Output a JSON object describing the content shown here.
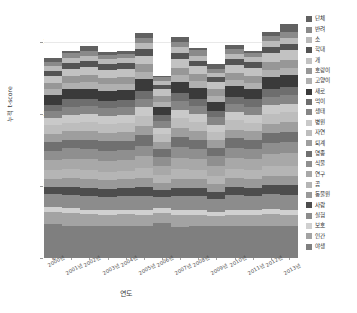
{
  "chart": {
    "type": "bar",
    "title": "",
    "xlabel": "연도",
    "ylabel": "누적 t-score",
    "ytick_labels": [
      "0",
      "100",
      "200",
      "300"
    ],
    "legend_position": "right"
  },
  "chart_data": {
    "type": "bar",
    "stacked": true,
    "title": "",
    "xlabel": "연도",
    "ylabel": "누적 t-score",
    "ylim": [
      0,
      330
    ],
    "yticks": [
      0,
      100,
      200,
      300
    ],
    "grid": true,
    "legend_position": "right",
    "categories": [
      "2000년",
      "2001년",
      "2002년",
      "2003년",
      "2004년",
      "2005년",
      "2006년",
      "2007년",
      "2008년",
      "2009년",
      "2010년",
      "2011년",
      "2012년",
      "2013년"
    ],
    "totals": [
      277,
      288,
      294,
      288,
      288,
      322,
      262,
      307,
      302,
      269,
      295,
      287,
      313,
      324
    ],
    "series": [
      {
        "name": "야생",
        "color": "#7f7f7f",
        "values": [
          47,
          45,
          44,
          44,
          44,
          44,
          48,
          43,
          44,
          45,
          44,
          44,
          45,
          44
        ]
      },
      {
        "name": "인간",
        "color": "#a3a3a3",
        "values": [
          17,
          18,
          17,
          16,
          17,
          16,
          15,
          17,
          16,
          13,
          16,
          16,
          16,
          16
        ]
      },
      {
        "name": "보호",
        "color": "#d0d0d0",
        "values": [
          7,
          7,
          6,
          6,
          6,
          6,
          6,
          6,
          6,
          6,
          7,
          7,
          7,
          7
        ]
      },
      {
        "name": "실험",
        "color": "#8c8c8c",
        "values": [
          18,
          18,
          19,
          19,
          19,
          20,
          16,
          20,
          20,
          18,
          20,
          19,
          21,
          21
        ]
      },
      {
        "name": "사람",
        "color": "#4d4d4d",
        "values": [
          10,
          11,
          11,
          11,
          11,
          12,
          9,
          11,
          11,
          10,
          12,
          11,
          12,
          13
        ]
      },
      {
        "name": "동물원",
        "color": "#999999",
        "values": [
          11,
          12,
          12,
          12,
          12,
          13,
          10,
          13,
          12,
          11,
          12,
          12,
          13,
          13
        ]
      },
      {
        "name": "곰",
        "color": "#b5b5b5",
        "values": [
          12,
          12,
          13,
          12,
          12,
          14,
          11,
          13,
          13,
          11,
          13,
          13,
          14,
          14
        ]
      },
      {
        "name": "연구",
        "color": "#a8a8a8",
        "values": [
          14,
          15,
          15,
          15,
          15,
          16,
          13,
          16,
          15,
          14,
          15,
          15,
          16,
          17
        ]
      },
      {
        "name": "식물",
        "color": "#8f8f8f",
        "values": [
          13,
          14,
          14,
          14,
          14,
          15,
          12,
          15,
          14,
          13,
          14,
          14,
          15,
          16
        ]
      },
      {
        "name": "영종",
        "color": "#707070",
        "values": [
          12,
          12,
          13,
          13,
          13,
          14,
          11,
          14,
          13,
          12,
          13,
          13,
          14,
          14
        ]
      },
      {
        "name": "퇴계",
        "color": "#9e9e9e",
        "values": [
          11,
          12,
          12,
          12,
          12,
          13,
          10,
          13,
          12,
          11,
          12,
          12,
          13,
          13
        ]
      },
      {
        "name": "자연",
        "color": "#bdbdbd",
        "values": [
          12,
          12,
          13,
          12,
          12,
          14,
          11,
          13,
          13,
          11,
          13,
          12,
          14,
          14
        ]
      },
      {
        "name": "병원",
        "color": "#c9c9c9",
        "values": [
          10,
          11,
          11,
          11,
          11,
          12,
          9,
          12,
          11,
          10,
          11,
          11,
          12,
          12
        ]
      },
      {
        "name": "생태",
        "color": "#858585",
        "values": [
          10,
          11,
          11,
          11,
          11,
          12,
          9,
          12,
          11,
          10,
          11,
          11,
          12,
          12
        ]
      },
      {
        "name": "먹이",
        "color": "#6e6e6e",
        "values": [
          9,
          10,
          10,
          10,
          10,
          11,
          8,
          11,
          10,
          9,
          10,
          10,
          11,
          11
        ]
      },
      {
        "name": "새로",
        "color": "#3a3a3a",
        "values": [
          13,
          14,
          14,
          14,
          14,
          16,
          12,
          15,
          15,
          13,
          15,
          14,
          16,
          17
        ]
      },
      {
        "name": "고양이",
        "color": "#b0b0b0",
        "values": [
          8,
          9,
          9,
          9,
          9,
          10,
          7,
          10,
          9,
          8,
          9,
          9,
          10,
          10
        ]
      },
      {
        "name": "호랑이",
        "color": "#979797",
        "values": [
          9,
          9,
          10,
          9,
          9,
          11,
          8,
          10,
          10,
          9,
          10,
          10,
          11,
          11
        ]
      },
      {
        "name": "개",
        "color": "#c2c2c2",
        "values": [
          10,
          11,
          11,
          11,
          11,
          12,
          9,
          12,
          11,
          10,
          11,
          11,
          12,
          13
        ]
      },
      {
        "name": "학대",
        "color": "#545454",
        "values": [
          7,
          8,
          8,
          8,
          8,
          9,
          6,
          9,
          8,
          7,
          8,
          8,
          9,
          9
        ]
      },
      {
        "name": "소",
        "color": "#bababa",
        "values": [
          6,
          7,
          7,
          7,
          7,
          8,
          6,
          8,
          7,
          6,
          7,
          7,
          8,
          8
        ]
      },
      {
        "name": "반려",
        "color": "#8a8a8a",
        "values": [
          6,
          6,
          7,
          6,
          6,
          7,
          5,
          7,
          7,
          6,
          7,
          6,
          7,
          8
        ]
      },
      {
        "name": "단체",
        "color": "#616161",
        "values": [
          5,
          4,
          7,
          4,
          4,
          7,
          1,
          6,
          4,
          6,
          5,
          2,
          5,
          11
        ]
      }
    ]
  },
  "legend": {
    "entries": [
      {
        "label": "단체",
        "color": "#616161"
      },
      {
        "label": "반려",
        "color": "#8a8a8a"
      },
      {
        "label": "소",
        "color": "#bababa"
      },
      {
        "label": "학대",
        "color": "#545454"
      },
      {
        "label": "개",
        "color": "#c2c2c2"
      },
      {
        "label": "호랑이",
        "color": "#979797"
      },
      {
        "label": "고양이",
        "color": "#b0b0b0"
      },
      {
        "label": "새로",
        "color": "#3a3a3a"
      },
      {
        "label": "먹이",
        "color": "#6e6e6e"
      },
      {
        "label": "생태",
        "color": "#858585"
      },
      {
        "label": "병원",
        "color": "#c9c9c9"
      },
      {
        "label": "자연",
        "color": "#bdbdbd"
      },
      {
        "label": "퇴계",
        "color": "#9e9e9e"
      },
      {
        "label": "영종",
        "color": "#707070"
      },
      {
        "label": "식물",
        "color": "#8f8f8f"
      },
      {
        "label": "연구",
        "color": "#a8a8a8"
      },
      {
        "label": "곰",
        "color": "#b5b5b5"
      },
      {
        "label": "동물원",
        "color": "#999999"
      },
      {
        "label": "사람",
        "color": "#4d4d4d"
      },
      {
        "label": "실험",
        "color": "#8c8c8c"
      },
      {
        "label": "보호",
        "color": "#d0d0d0"
      },
      {
        "label": "인간",
        "color": "#a3a3a3"
      },
      {
        "label": "야생",
        "color": "#7f7f7f"
      }
    ]
  }
}
